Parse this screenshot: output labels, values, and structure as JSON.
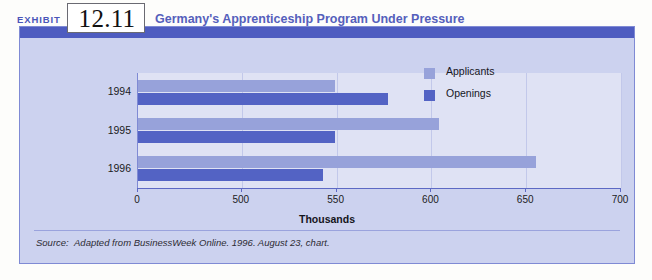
{
  "exhibit": {
    "label": "EXHIBIT",
    "number": "12.11",
    "title": "Germany's Apprenticeship Program Under Pressure"
  },
  "source": {
    "prefix": "Source:",
    "text": "Adapted from BusinessWeek Online. 1996. August 23, chart."
  },
  "colors": {
    "applicants": "#97a2da",
    "openings": "#5363c4",
    "header_band": "#4e5cc0",
    "panel_background": "#ccd2ef",
    "plot_background": "#dfe2f4",
    "title_text": "#5560bb",
    "frame_border": "#7f8ad4"
  },
  "chart_data": {
    "type": "bar",
    "orientation": "horizontal",
    "title": "Germany's Apprenticeship Program Under Pressure",
    "xlabel": "Thousands",
    "ylabel": "",
    "categories": [
      "1994",
      "1995",
      "1996"
    ],
    "series": [
      {
        "name": "Applicants",
        "color": "#97a2da",
        "values": [
          549,
          604,
          655
        ]
      },
      {
        "name": "Openings",
        "color": "#5363c4",
        "values": [
          577,
          549,
          543
        ]
      }
    ],
    "xticks": [
      0,
      500,
      550,
      600,
      650,
      700
    ],
    "xtick_labels": [
      "0",
      "500",
      "550",
      "600",
      "650",
      "700"
    ],
    "axis_break": true,
    "axis_break_note": "x-axis breaks between 0 and 500",
    "xlim": [
      0,
      700
    ],
    "grid": true,
    "legend_position": "top-right"
  }
}
